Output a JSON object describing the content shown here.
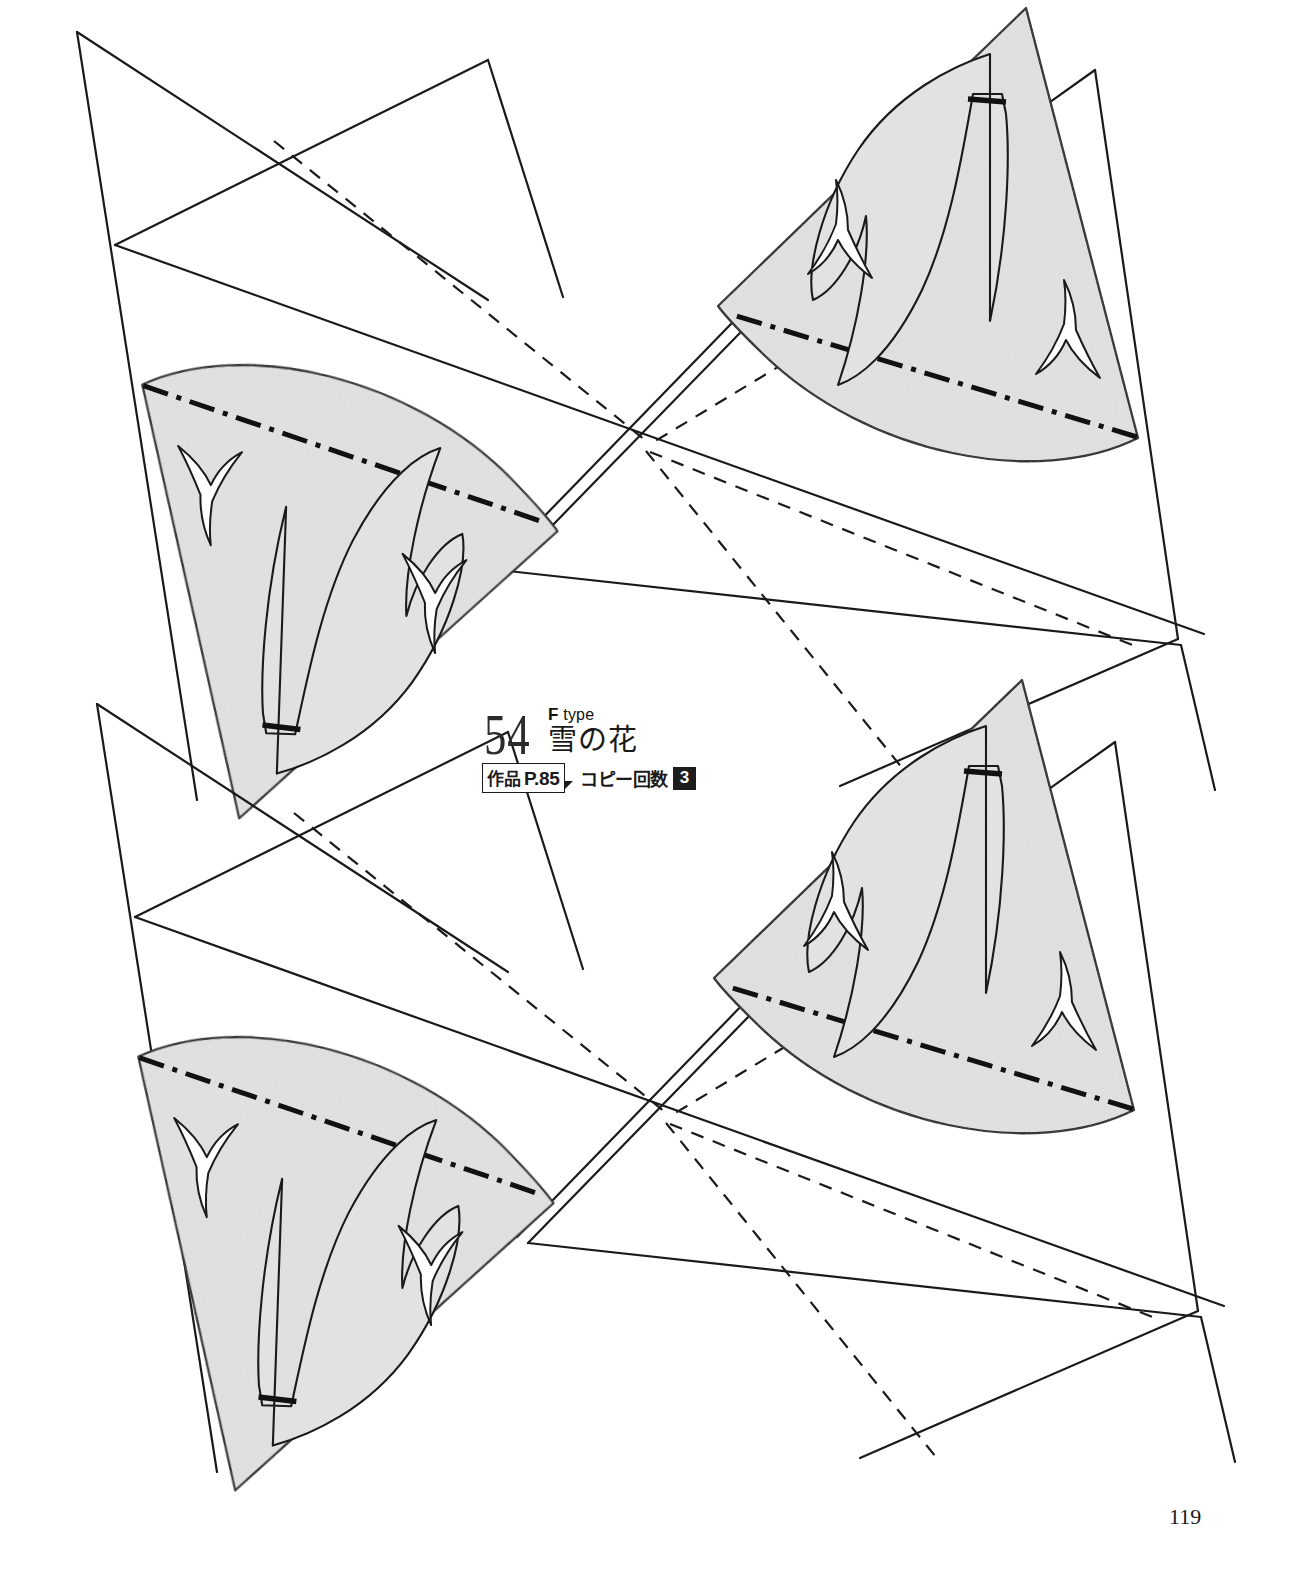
{
  "page": {
    "number": "119",
    "background_color": "#ffffff",
    "ink_color": "#1a1a1a",
    "shade_color": "#e2e2e2"
  },
  "title_block": {
    "pattern_number": "54",
    "type_prefix": "F",
    "type_word": "type",
    "pattern_name": "雪の花",
    "work_ref_label": "作品",
    "work_ref_page": "P.85",
    "copies_label": "コピー回数",
    "copies_count": "3"
  },
  "pattern": {
    "title": "雪の花 (F type) — kirigami fold-and-cut pattern",
    "motif_name": "snow flower",
    "units": 2,
    "unit_names": [
      "upper-unit",
      "lower-unit"
    ],
    "wedges_per_unit": 2,
    "wedge_names": [
      "left-wedge",
      "right-wedge"
    ],
    "line_legend": [
      {
        "style": "solid",
        "meaning": "cut / outline edge"
      },
      {
        "style": "dashed",
        "meaning": "guide line"
      },
      {
        "style": "dash-dot",
        "meaning": "fold line (mountain)"
      },
      {
        "style": "thick-dash",
        "meaning": "keep-attached segment"
      }
    ],
    "cutout_shapes": [
      "flower-petal-pair",
      "small-bird-left",
      "small-bird-right"
    ]
  }
}
